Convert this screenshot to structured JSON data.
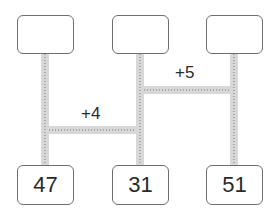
{
  "diagram": {
    "type": "ladder-puzzle",
    "top_boxes": [
      {
        "value": ""
      },
      {
        "value": ""
      },
      {
        "value": ""
      }
    ],
    "bottom_boxes": [
      {
        "value": "47"
      },
      {
        "value": "31"
      },
      {
        "value": "51"
      }
    ],
    "rungs": [
      {
        "label": "+5",
        "from": 2,
        "to": 3
      },
      {
        "label": "+4",
        "from": 1,
        "to": 2
      }
    ],
    "colors": {
      "pipe": "#d8d8d8",
      "border": "#6e6e6e",
      "text": "#2a2a2a"
    }
  }
}
